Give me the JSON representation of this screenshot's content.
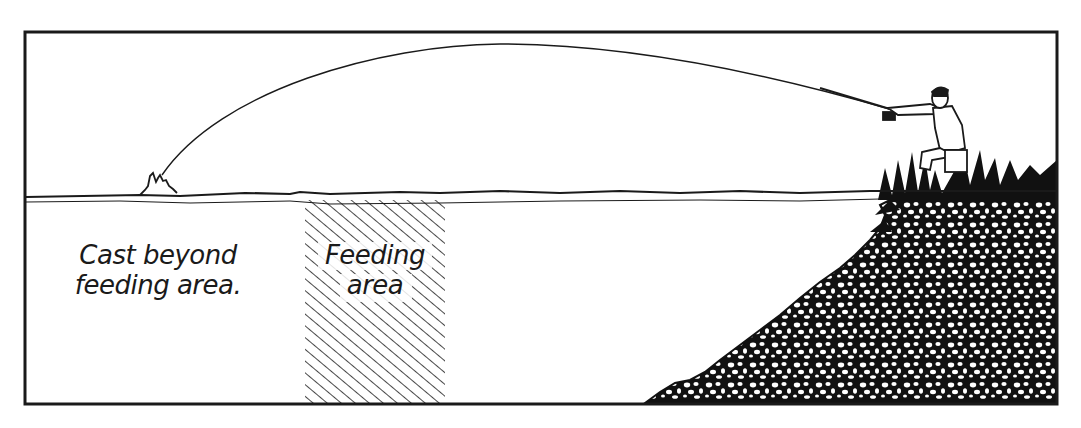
{
  "diagram": {
    "type": "illustration",
    "colors": {
      "ink": "#1a1a1a",
      "paper": "#ffffff"
    },
    "labels": {
      "cast_beyond": {
        "line1": "Cast beyond",
        "line2": "feeding area."
      },
      "feeding_area": {
        "line1": "Feeding",
        "line2": "area"
      }
    },
    "elements": [
      "frame",
      "water-surface",
      "cast-line-arc",
      "splash",
      "feeding-area-hatch",
      "bank-slope",
      "grass-tufts",
      "angler-figure",
      "fishing-rod"
    ]
  }
}
